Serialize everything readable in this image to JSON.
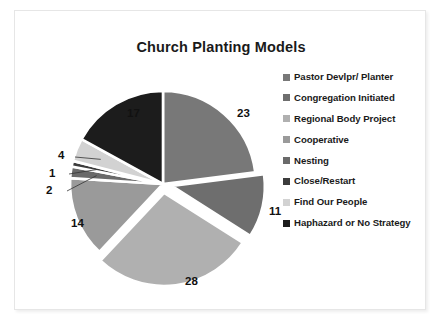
{
  "chart_data": {
    "type": "pie",
    "title": "Church Planting Models",
    "xlabel": "",
    "ylabel": "",
    "legend_position": "right",
    "grid": false,
    "start_angle_deg": 0,
    "direction": "clockwise",
    "total": 100,
    "categories": [
      "Pastor Devlpr/ Planter",
      "Congregation Initiated",
      "Regional Body Project",
      "Cooperative",
      "Nesting",
      "Close/Restart",
      "Find Our People",
      "Haphazard or No Strategy"
    ],
    "values": [
      23,
      11,
      28,
      14,
      2,
      1,
      4,
      17
    ],
    "labels": [
      "23",
      "11",
      "28",
      "14",
      "2",
      "1",
      "4",
      "17"
    ],
    "colors": [
      "#787878",
      "#6e6e6e",
      "#b0b0b0",
      "#9a9a9a",
      "#6a6a6a",
      "#3c3c3c",
      "#d2d2d2",
      "#1c1c1c"
    ],
    "exploded": [
      false,
      true,
      true,
      false,
      false,
      false,
      false,
      false
    ]
  },
  "slide": {
    "title": "Church Planting Models"
  },
  "legend": {
    "items": [
      {
        "label": "Pastor Devlpr/ Planter",
        "color": "#787878"
      },
      {
        "label": "Congregation Initiated",
        "color": "#6e6e6e"
      },
      {
        "label": "Regional Body Project",
        "color": "#b0b0b0"
      },
      {
        "label": "Cooperative",
        "color": "#9a9a9a"
      },
      {
        "label": "Nesting",
        "color": "#6a6a6a"
      },
      {
        "label": "Close/Restart",
        "color": "#3c3c3c"
      },
      {
        "label": "Find Our People",
        "color": "#d2d2d2"
      },
      {
        "label": "Haphazard or No Strategy",
        "color": "#1c1c1c"
      }
    ]
  },
  "data_labels": [
    {
      "text": "23",
      "left": 196,
      "top": 28
    },
    {
      "text": "11",
      "left": 228,
      "top": 126
    },
    {
      "text": "28",
      "left": 144,
      "top": 196
    },
    {
      "text": "14",
      "left": 30,
      "top": 138
    },
    {
      "text": "2",
      "left": 5,
      "top": 105
    },
    {
      "text": "1",
      "left": 8,
      "top": 88
    },
    {
      "text": "4",
      "left": 17,
      "top": 70
    },
    {
      "text": "17",
      "left": 86,
      "top": 28
    }
  ]
}
